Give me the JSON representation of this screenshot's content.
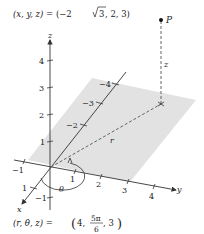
{
  "diagram": {
    "top_equation": {
      "lhs": "(x, y, z)",
      "eq": " = ",
      "rhs_open": "(−2",
      "sqrt_arg": "3",
      "rhs_close": ", 2, 3)"
    },
    "bottom_equation": {
      "lhs": "(r, θ, z)",
      "eq": " = ",
      "first": "4,",
      "frac_num": "5π",
      "frac_den": "6",
      "last": ", 3"
    },
    "point_label": "P",
    "z_segment_label": "z",
    "r_segment_label": "r",
    "angle_label": "θ",
    "axes": {
      "x": {
        "label": "x",
        "ticks": [
          "1",
          "−2",
          "−3",
          "−4"
        ]
      },
      "y": {
        "label": "y",
        "ticks": [
          "−1",
          "1",
          "2",
          "3",
          "4"
        ]
      },
      "z": {
        "label": "z",
        "ticks": [
          "4",
          "3",
          "2",
          "1",
          "−1"
        ]
      }
    },
    "colors": {
      "plane": "#e2e2e2",
      "axis": "#333333",
      "dashed": "#555555"
    }
  }
}
